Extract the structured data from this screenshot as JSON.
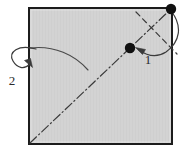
{
  "figure": {
    "type": "instructional-fold-diagram",
    "canvas": {
      "width": 182,
      "height": 151
    },
    "background_color": "#ffffff"
  },
  "paper": {
    "name": "square-sheet",
    "shape": "square",
    "fill_color": "#d2d2d2",
    "border_color": "#1c1c1c",
    "border_width": 2,
    "x": 29,
    "y": 8,
    "width": 143,
    "height": 136
  },
  "creases": {
    "diagonal_valley": {
      "name": "diagonal-dash-dot-crease",
      "style": "dash-dot",
      "color": "#3a3a3a",
      "from": {
        "x": 30,
        "y": 143
      },
      "to": {
        "x": 171,
        "y": 9
      }
    },
    "corner_fold": {
      "name": "corner-dashed-crease",
      "style": "dashed",
      "color": "#3a3a3a",
      "from": {
        "x": 136,
        "y": 12
      },
      "to": {
        "x": 177,
        "y": 54
      }
    }
  },
  "points": [
    {
      "name": "corner-point",
      "label": "",
      "x": 171,
      "y": 9,
      "radius": 5.2,
      "color": "#111111"
    },
    {
      "name": "target-point",
      "label": "",
      "x": 130,
      "y": 48,
      "radius": 5.2,
      "color": "#111111"
    }
  ],
  "arrows": [
    {
      "name": "fold-arrow-1",
      "step": "1",
      "description": "corner folds inward to meet the marked point",
      "color": "#3a3a3a",
      "path": "M 171 11 C 183 26, 180 42, 166 52 C 155 59, 146 56, 139 50",
      "head": {
        "x": 136,
        "y": 48,
        "angle": 205
      }
    },
    {
      "name": "fold-arrow-2",
      "step": "2",
      "description": "edge swings out to the left and folds back",
      "color": "#3a3a3a",
      "path": "M 34 49 C 16 45, 9 53, 14 61 C 18 68, 25 69, 30 63",
      "head": {
        "x": 31,
        "y": 64,
        "angle": 128
      }
    }
  ],
  "guide_curve": {
    "name": "sweep-guide-curve",
    "color": "#4a4a4a",
    "path": "M 30 48 C 54 45, 75 55, 88 70"
  },
  "labels": [
    {
      "name": "step-label-1",
      "text": "1",
      "x": 148,
      "y": 64
    },
    {
      "name": "step-label-2",
      "text": "2",
      "x": 8,
      "y": 85
    }
  ]
}
